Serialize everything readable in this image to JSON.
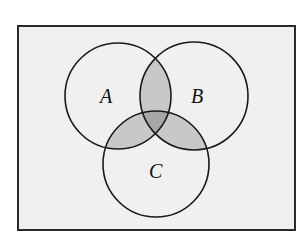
{
  "diagram": {
    "type": "venn",
    "sets": [
      {
        "label": "A",
        "cx": 118,
        "cy": 96,
        "r": 53
      },
      {
        "label": "B",
        "cx": 194,
        "cy": 96,
        "r": 54
      },
      {
        "label": "C",
        "cx": 156,
        "cy": 164,
        "r": 53
      }
    ],
    "shaded_regions": [
      "A∩B",
      "A∩C",
      "B∩C",
      "A∩B∩C"
    ],
    "colors": {
      "background": "#ffffff",
      "universe_fill": "#f0f0f0",
      "stroke": "#1a1a1a",
      "pair_shade": "#c8c8c8",
      "triple_shade": "#a6a6a6"
    },
    "universe": {
      "x": 18,
      "y": 26,
      "width": 277,
      "height": 204
    }
  }
}
